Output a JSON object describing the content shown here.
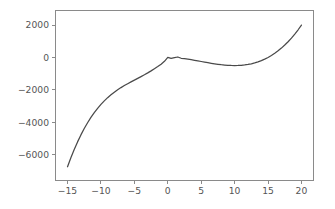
{
  "figure": {
    "background_color": "#ffffff",
    "axes_color": "#8a8a8a",
    "tick_label_color": "#555555",
    "line_color": "#4a4a4a"
  },
  "chart_data": {
    "type": "line",
    "title": "",
    "xlabel": "",
    "ylabel": "",
    "xlim": [
      -16.8,
      21.8
    ],
    "ylim": [
      -7600,
      2900
    ],
    "xticks": [
      -15,
      -10,
      -5,
      0,
      5,
      10,
      15,
      20
    ],
    "xtick_labels": [
      "−15",
      "−10",
      "−5",
      "0",
      "5",
      "10",
      "15",
      "20"
    ],
    "yticks": [
      2000,
      0,
      -2000,
      -4000,
      -6000
    ],
    "ytick_labels": [
      "2000",
      "0",
      "−2000",
      "−4000",
      "−6000"
    ],
    "grid": false,
    "legend": null,
    "legend_position": "none",
    "series": [
      {
        "name": "x^3 - 15x^2",
        "x": [
          -15,
          -14.5,
          -14,
          -13.5,
          -13,
          -12.5,
          -12,
          -11.5,
          -11,
          -10.5,
          -10,
          -9.5,
          -9,
          -8.5,
          -8,
          -7.5,
          -7,
          -6.5,
          -6,
          -5.5,
          -5,
          -4.5,
          -4,
          -3.5,
          -3,
          -2.5,
          -2,
          -1.5,
          -1,
          -0.5,
          0,
          0.5,
          1,
          1.5,
          2,
          2.5,
          3,
          3.5,
          4,
          4.5,
          5,
          5.5,
          6,
          6.5,
          7,
          7.5,
          8,
          8.5,
          9,
          9.5,
          10,
          10.5,
          11,
          11.5,
          12,
          12.5,
          13,
          13.5,
          14,
          14.5,
          15,
          15.5,
          16,
          16.5,
          17,
          17.5,
          18,
          18.5,
          19,
          19.5,
          20
        ],
        "y": [
          -6750,
          -6195.1,
          -5684,
          -5214.4,
          -4784,
          -4390.6,
          -4032,
          -3705.9,
          -3410,
          -3142.1,
          -2900,
          -2681.4,
          -2484,
          -2305.6,
          -2144,
          -1996.9,
          -1862,
          -1737.1,
          -1620,
          -1508.4,
          -1400,
          -1292.6,
          -1184,
          -1071.9,
          -954,
          -828.1,
          -692,
          -563.5,
          -416,
          -237.6,
          0,
          -62.5,
          -14,
          28.1,
          -52,
          -78.1,
          -108,
          -140.9,
          -176,
          -212.6,
          -250,
          -287.4,
          -324,
          -358.9,
          -392,
          -421.9,
          -448,
          -469.4,
          -486,
          -496.4,
          -500,
          -496.1,
          -484,
          -463.1,
          -432,
          -390.6,
          -338,
          -273.4,
          -196,
          -105.1,
          0,
          120.1,
          256,
          408.4,
          578,
          765.6,
          972,
          1197.6,
          1444,
          1710.4,
          2000
        ]
      }
    ]
  }
}
